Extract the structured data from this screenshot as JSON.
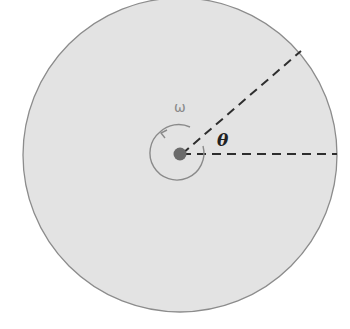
{
  "diagram": {
    "disk": {
      "cx": 180,
      "cy": 155,
      "r": 157,
      "fill": "#e3e3e3",
      "stroke": "#8c8c8c"
    },
    "center_dot": {
      "r": 6,
      "fill": "#6b6b6b"
    },
    "labels": {
      "omega": "ω",
      "theta": "θ"
    },
    "reference_line": {
      "x2": 337,
      "y2": 155
    },
    "radius_line": {
      "x2": 301,
      "y2": 51
    }
  }
}
